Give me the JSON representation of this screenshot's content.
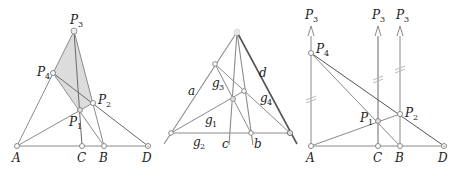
{
  "panels": [
    {
      "id": "left",
      "points": {
        "A": {
          "label": "A",
          "sub": "",
          "x": 17,
          "y": 146
        },
        "C": {
          "label": "C",
          "sub": "",
          "x": 82,
          "y": 146
        },
        "B": {
          "label": "B",
          "sub": "",
          "x": 104,
          "y": 146
        },
        "D": {
          "label": "D",
          "sub": "",
          "x": 148,
          "y": 146
        },
        "P1": {
          "label": "P",
          "sub": "1",
          "x": 80,
          "y": 110
        },
        "P2": {
          "label": "P",
          "sub": "2",
          "x": 93,
          "y": 103
        },
        "P3": {
          "label": "P",
          "sub": "3",
          "x": 74,
          "y": 31
        },
        "P4": {
          "label": "P",
          "sub": "4",
          "x": 53,
          "y": 73
        }
      },
      "shaded_quad": [
        "P3",
        "P4",
        "P1",
        "P2"
      ]
    },
    {
      "id": "middle",
      "lines": {
        "a": "a",
        "b": "b",
        "c": "c",
        "d": "d",
        "g1": {
          "label": "g",
          "sub": "1"
        },
        "g2": {
          "label": "g",
          "sub": "2"
        },
        "g3": {
          "label": "g",
          "sub": "3"
        },
        "g4": {
          "label": "g",
          "sub": "4"
        }
      }
    },
    {
      "id": "right",
      "points": {
        "A": {
          "label": "A",
          "sub": ""
        },
        "C": {
          "label": "C",
          "sub": ""
        },
        "B": {
          "label": "B",
          "sub": ""
        },
        "D": {
          "label": "D",
          "sub": ""
        },
        "P1": {
          "label": "P",
          "sub": "1"
        },
        "P2": {
          "label": "P",
          "sub": "2"
        },
        "P4": {
          "label": "P",
          "sub": "4"
        },
        "P3_arrows": [
          {
            "label": "P",
            "sub": "3"
          },
          {
            "label": "P",
            "sub": "3"
          },
          {
            "label": "P",
            "sub": "3"
          }
        ]
      }
    }
  ],
  "colors": {
    "line": "#8a8a8a",
    "line_dark": "#555555",
    "shade": "#d9d9d9",
    "point_fill": "#ffffff",
    "point_stroke": "#777777"
  }
}
